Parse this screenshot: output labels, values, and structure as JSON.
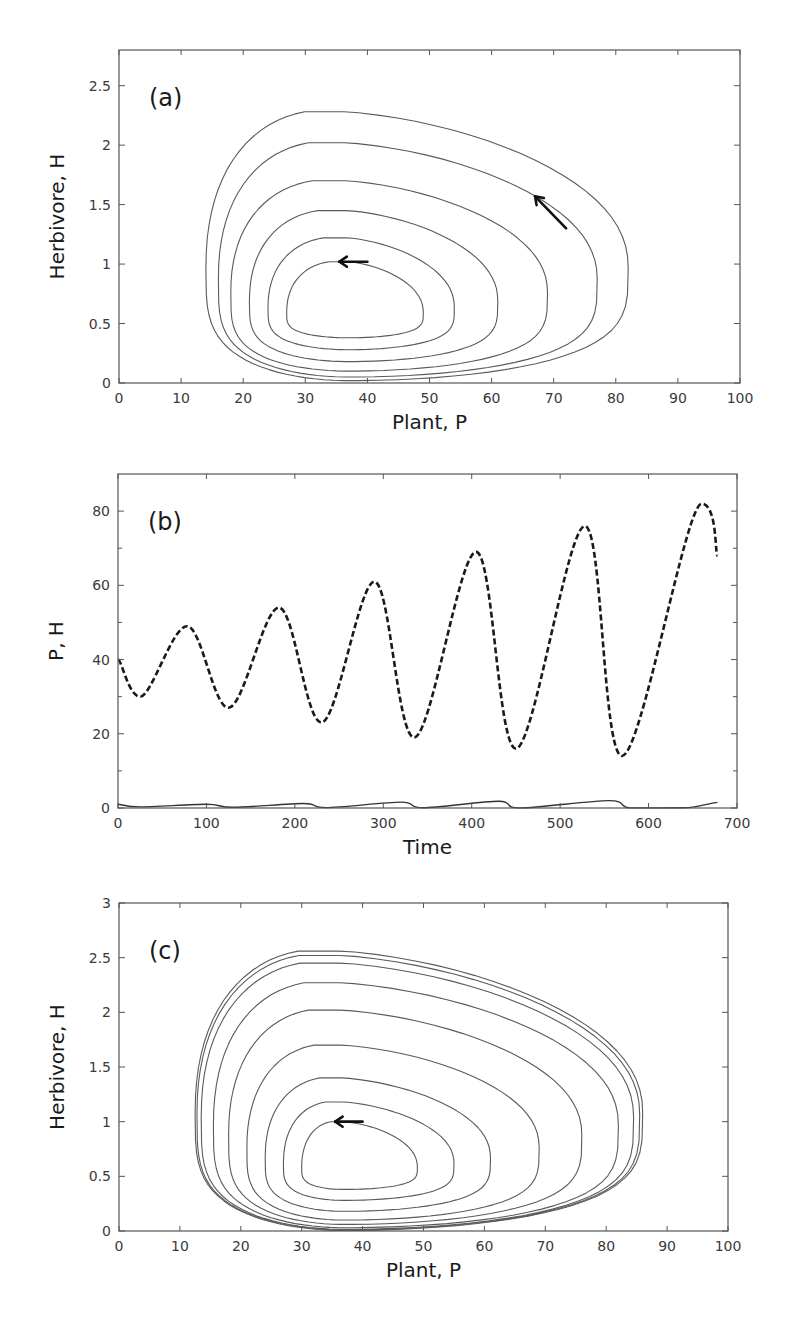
{
  "chart_data": [
    {
      "id": "a",
      "type": "line",
      "panel_label": "(a)",
      "title": "",
      "xlabel": "Plant, P",
      "ylabel": "Herbivore, H",
      "xlim": [
        0,
        100
      ],
      "ylim": [
        0,
        2.8
      ],
      "xticks": [
        0,
        10,
        20,
        30,
        40,
        50,
        60,
        70,
        80,
        90,
        100
      ],
      "yticks": [
        0,
        0.5,
        1,
        1.5,
        2,
        2.5
      ],
      "ytick_labels": [
        "0",
        "0.5",
        "1",
        "1.5",
        "2",
        "2.5"
      ],
      "grid": false,
      "description": "Phase-plane trajectory spiralling outward from near (37,0.7) — divergent oscillations",
      "orbits": [
        {
          "p_min": 27,
          "p_max": 49,
          "h_min": 0.38,
          "h_max": 1.02
        },
        {
          "p_min": 24,
          "p_max": 54,
          "h_min": 0.28,
          "h_max": 1.22
        },
        {
          "p_min": 21,
          "p_max": 61,
          "h_min": 0.18,
          "h_max": 1.45
        },
        {
          "p_min": 18,
          "p_max": 69,
          "h_min": 0.1,
          "h_max": 1.7
        },
        {
          "p_min": 16,
          "p_max": 77,
          "h_min": 0.05,
          "h_max": 2.02
        },
        {
          "p_min": 14,
          "p_max": 82,
          "h_min": 0.02,
          "h_max": 2.28
        }
      ],
      "annotations": [
        {
          "type": "arrow",
          "from": [
            40,
            1.02
          ],
          "to": [
            35.5,
            1.02
          ]
        },
        {
          "type": "arrow",
          "from": [
            72,
            1.3
          ],
          "to": [
            67,
            1.57
          ]
        }
      ]
    },
    {
      "id": "b",
      "type": "line",
      "panel_label": "(b)",
      "title": "",
      "xlabel": "Time",
      "ylabel": "P, H",
      "xlim": [
        0,
        700
      ],
      "ylim": [
        0,
        90
      ],
      "xticks": [
        0,
        100,
        200,
        300,
        400,
        500,
        600,
        700
      ],
      "yticks": [
        0,
        20,
        40,
        60,
        80
      ],
      "minor_yticks": [
        10,
        30,
        50,
        70
      ],
      "grid": false,
      "series": [
        {
          "name": "P",
          "style": "dashed",
          "x": [
            0,
            25,
            78,
            125,
            182,
            230,
            290,
            335,
            405,
            450,
            528,
            570,
            660,
            678
          ],
          "y": [
            40,
            30,
            49,
            27,
            54,
            23,
            61,
            19,
            69,
            16,
            76,
            14,
            82,
            68
          ]
        },
        {
          "name": "H",
          "style": "solid",
          "x": [
            0,
            25,
            100,
            130,
            210,
            235,
            320,
            345,
            430,
            455,
            555,
            580,
            640,
            678
          ],
          "y": [
            1.0,
            0.3,
            1.0,
            0.2,
            1.2,
            0.1,
            1.6,
            0.05,
            1.8,
            0.03,
            2.0,
            0.02,
            0.05,
            1.5
          ]
        }
      ]
    },
    {
      "id": "c",
      "type": "line",
      "panel_label": "(c)",
      "title": "",
      "xlabel": "Plant, P",
      "ylabel": "Herbivore, H",
      "xlim": [
        0,
        100
      ],
      "ylim": [
        0,
        3
      ],
      "xticks": [
        0,
        10,
        20,
        30,
        40,
        50,
        60,
        70,
        80,
        90,
        100
      ],
      "yticks": [
        0,
        0.5,
        1,
        1.5,
        2,
        2.5,
        3
      ],
      "ytick_labels": [
        "0",
        "0.5",
        "1",
        "1.5",
        "2",
        "2.5",
        "3"
      ],
      "grid": false,
      "description": "Phase-plane trajectory spiralling outward and converging onto a limit cycle",
      "orbits": [
        {
          "p_min": 30,
          "p_max": 49,
          "h_min": 0.38,
          "h_max": 1.0
        },
        {
          "p_min": 27,
          "p_max": 55,
          "h_min": 0.28,
          "h_max": 1.18
        },
        {
          "p_min": 24,
          "p_max": 61,
          "h_min": 0.18,
          "h_max": 1.4
        },
        {
          "p_min": 21,
          "p_max": 69,
          "h_min": 0.1,
          "h_max": 1.7
        },
        {
          "p_min": 18,
          "p_max": 76,
          "h_min": 0.06,
          "h_max": 2.02
        },
        {
          "p_min": 15.5,
          "p_max": 82,
          "h_min": 0.03,
          "h_max": 2.27
        },
        {
          "p_min": 13.5,
          "p_max": 84.5,
          "h_min": 0.015,
          "h_max": 2.45
        },
        {
          "p_min": 12.8,
          "p_max": 85.5,
          "h_min": 0.01,
          "h_max": 2.52
        },
        {
          "p_min": 12.5,
          "p_max": 86,
          "h_min": 0.005,
          "h_max": 2.56
        }
      ],
      "annotations": [
        {
          "type": "arrow",
          "from": [
            40,
            1.0
          ],
          "to": [
            35.5,
            1.0
          ]
        }
      ]
    }
  ]
}
